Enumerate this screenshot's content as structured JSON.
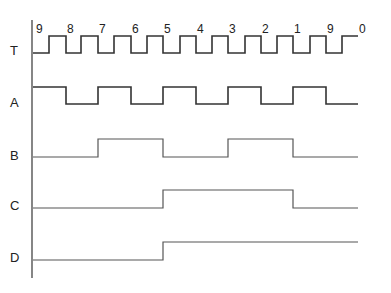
{
  "diagram": {
    "type": "timing-diagram",
    "axis": {
      "x": 32,
      "y_top": 20,
      "y_bottom": 278
    },
    "edge_x": [
      49,
      66,
      81,
      98,
      114,
      131,
      147,
      163,
      180,
      196,
      212,
      228,
      245,
      261,
      277,
      293,
      310,
      326,
      342,
      358
    ],
    "clock_labels": [
      "9",
      "8",
      "7",
      "6",
      "5",
      "4",
      "3",
      "2",
      "1",
      "9",
      "0"
    ],
    "clock_label_x": [
      35,
      66,
      98,
      131,
      163,
      196,
      228,
      261,
      293,
      326,
      358
    ],
    "signals": [
      {
        "name": "T",
        "label_y": 55,
        "high_y": 36,
        "low_y": 53,
        "style": "wave",
        "description": "clock: starts low, rises at half-period, falls at each labeled count edge",
        "levels": [
          0,
          1,
          0,
          1,
          0,
          1,
          0,
          1,
          0,
          1,
          0,
          1,
          0,
          1,
          0,
          1,
          0,
          1,
          0,
          1
        ],
        "start_x": 33,
        "end_x": 358
      },
      {
        "name": "A",
        "label_y": 107,
        "high_y": 87,
        "low_y": 104,
        "style": "wave",
        "levels_by_period": [
          1,
          0,
          1,
          0,
          1,
          0,
          1,
          0,
          1,
          0
        ],
        "start_x": 33,
        "end_x": 358
      },
      {
        "name": "B",
        "label_y": 160,
        "high_y": 139,
        "low_y": 157,
        "style": "wave-thin",
        "levels_by_period": [
          0,
          0,
          1,
          1,
          0,
          0,
          1,
          1,
          0,
          0
        ],
        "start_x": 33,
        "end_x": 358
      },
      {
        "name": "C",
        "label_y": 210,
        "high_y": 190,
        "low_y": 208,
        "style": "wave-thin",
        "levels_by_period": [
          0,
          0,
          0,
          0,
          1,
          1,
          1,
          1,
          0,
          0
        ],
        "start_x": 33,
        "end_x": 358
      },
      {
        "name": "D",
        "label_y": 262,
        "high_y": 242,
        "low_y": 260,
        "style": "wave-thin",
        "levels_by_period": [
          0,
          0,
          0,
          0,
          1,
          1,
          1,
          1,
          1,
          1
        ],
        "start_x": 33,
        "end_x": 358
      }
    ],
    "period_boundaries_x": [
      33,
      66,
      98,
      131,
      163,
      196,
      228,
      261,
      293,
      326,
      358
    ]
  }
}
